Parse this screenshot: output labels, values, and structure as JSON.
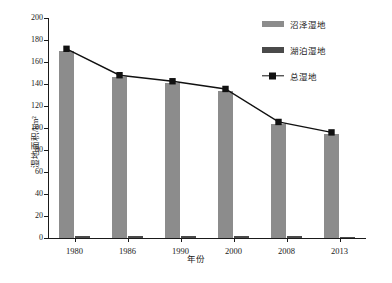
{
  "chart_data": {
    "type": "bar",
    "title": "",
    "xlabel": "年份",
    "ylabel": "湿地面积/km²",
    "categories": [
      "1980",
      "1986",
      "1990",
      "2000",
      "2008",
      "2013"
    ],
    "ylim": [
      0,
      200
    ],
    "yticks": [
      0,
      20,
      40,
      60,
      80,
      100,
      120,
      140,
      160,
      180,
      200
    ],
    "grid": false,
    "legend_position": "top-right",
    "series": [
      {
        "name": "沼泽湿地",
        "kind": "bar",
        "color": "#8c8c8c",
        "values": [
          170,
          146,
          141,
          134,
          104,
          95
        ]
      },
      {
        "name": "湖泊湿地",
        "kind": "bar",
        "color": "#4a4a4a",
        "values": [
          2,
          2,
          1.5,
          1.5,
          1.5,
          1
        ]
      },
      {
        "name": "总湿地",
        "kind": "line",
        "color": "#111111",
        "marker": "square",
        "values": [
          172,
          148,
          142.5,
          135.5,
          105.5,
          96
        ]
      }
    ]
  },
  "legend": {
    "items": [
      {
        "label": "沼泽湿地"
      },
      {
        "label": "湖泊湿地"
      },
      {
        "label": "总湿地"
      }
    ]
  }
}
